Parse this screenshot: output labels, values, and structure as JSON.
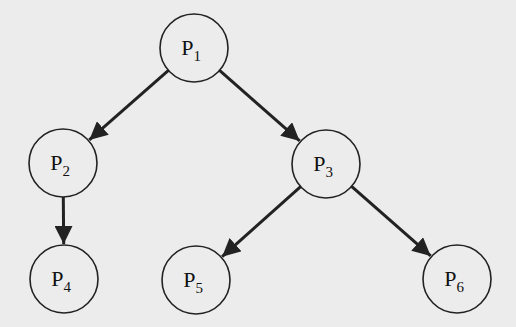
{
  "diagram": {
    "type": "process-tree",
    "background": "#ececec",
    "stroke": "#222222",
    "node_radius": 34,
    "nodes": [
      {
        "id": "P1",
        "base": "P",
        "sub": "1",
        "x": 194,
        "y": 48
      },
      {
        "id": "P2",
        "base": "P",
        "sub": "2",
        "x": 63,
        "y": 163
      },
      {
        "id": "P3",
        "base": "P",
        "sub": "3",
        "x": 326,
        "y": 164
      },
      {
        "id": "P4",
        "base": "P",
        "sub": "4",
        "x": 64,
        "y": 279
      },
      {
        "id": "P5",
        "base": "P",
        "sub": "5",
        "x": 196,
        "y": 280
      },
      {
        "id": "P6",
        "base": "P",
        "sub": "6",
        "x": 457,
        "y": 279
      }
    ],
    "edges": [
      {
        "from": "P1",
        "to": "P2"
      },
      {
        "from": "P1",
        "to": "P3"
      },
      {
        "from": "P2",
        "to": "P4"
      },
      {
        "from": "P3",
        "to": "P5"
      },
      {
        "from": "P3",
        "to": "P6"
      }
    ]
  }
}
